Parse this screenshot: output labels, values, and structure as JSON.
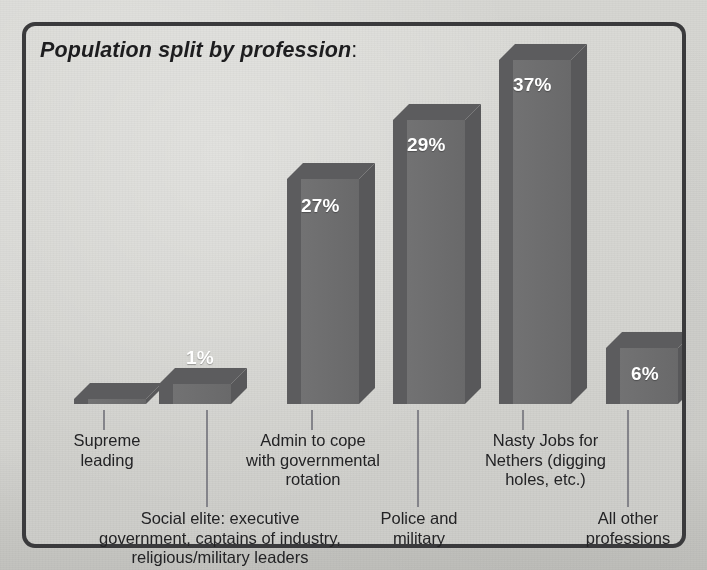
{
  "chart_data": {
    "type": "bar",
    "title": "Population split by profession",
    "title_suffix": ":",
    "xlabel": "",
    "ylabel": "",
    "ylim": [
      0,
      40
    ],
    "grid": false,
    "legend": null,
    "style": "3d-column",
    "unit": "%",
    "categories": [
      "Supreme\nleading",
      "Social elite: executive\ngovernment, captains of industry,\nreligious/military leaders",
      "Admin to cope\nwith governmental\nrotation",
      "Police and\nmilitary",
      "Nasty Jobs for\nNethers (digging\nholes, etc.)",
      "All other\nprofessions"
    ],
    "values": [
      0,
      1,
      27,
      29,
      37,
      6
    ],
    "value_labels": [
      "",
      "1%",
      "27%",
      "29%",
      "37%",
      "6%"
    ],
    "label_inside": [
      false,
      false,
      true,
      true,
      true,
      true
    ],
    "colors": {
      "bar_front": "#6f6f70",
      "bar_side": "#58585a",
      "bar_top": "#5c5c5e",
      "background": "#d4d4d0",
      "border": "#3a3a3c",
      "text": "#232325",
      "value_text": "#ffffff",
      "leader_line": "#7c7c7e"
    }
  },
  "bars": [
    {
      "name": "supreme-leading",
      "value_label": "",
      "x": 48,
      "w": 72,
      "top": 373
    },
    {
      "name": "social-elite",
      "value_label": "1%",
      "x": 133,
      "w": 72,
      "top": 358
    },
    {
      "name": "admin-rotation",
      "value_label": "27%",
      "x": 261,
      "w": 72,
      "top": 153
    },
    {
      "name": "police-military",
      "value_label": "29%",
      "x": 367,
      "w": 72,
      "top": 94
    },
    {
      "name": "nasty-jobs",
      "value_label": "37%",
      "x": 473,
      "w": 72,
      "top": 34
    },
    {
      "name": "all-other-professions",
      "value_label": "6%",
      "x": 580,
      "w": 72,
      "top": 322
    }
  ]
}
